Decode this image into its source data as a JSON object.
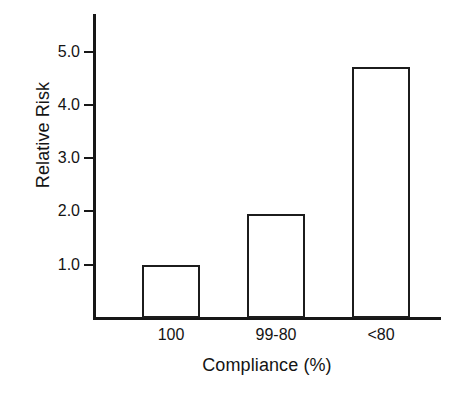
{
  "chart_data": {
    "type": "bar",
    "title": "",
    "subtitle": "",
    "xlabel": "Compliance (%)",
    "ylabel": "Relative Risk",
    "categories": [
      "100",
      "99-80",
      "<80"
    ],
    "values": [
      1.0,
      1.95,
      4.7
    ],
    "series": [
      {
        "name": "Relative Risk",
        "values": [
          1.0,
          1.95,
          4.7
        ]
      }
    ],
    "ytick_labels": [
      "1.0",
      "2.0",
      "3.0",
      "4.0",
      "5.0"
    ],
    "ytick_values": [
      1.0,
      2.0,
      3.0,
      4.0,
      5.0
    ],
    "ylim": [
      0,
      5.7
    ],
    "xlim": [
      0,
      3
    ],
    "grid": false,
    "legend": false,
    "legend_position": "none",
    "bar_fill": "#ffffff",
    "bar_edge": "#1c1c1c",
    "axis_color": "#171717",
    "background": "#ffffff",
    "annotations": []
  },
  "axes": {
    "y_title": "Relative Risk",
    "x_title": "Compliance (%)"
  },
  "ticks": {
    "y": [
      {
        "label": "1.0",
        "value": 1.0
      },
      {
        "label": "2.0",
        "value": 2.0
      },
      {
        "label": "3.0",
        "value": 3.0
      },
      {
        "label": "4.0",
        "value": 4.0
      },
      {
        "label": "5.0",
        "value": 5.0
      }
    ]
  },
  "bars": [
    {
      "category": "100",
      "value": 1.0
    },
    {
      "category": "99-80",
      "value": 1.95
    },
    {
      "category": "<80",
      "value": 4.7
    }
  ]
}
